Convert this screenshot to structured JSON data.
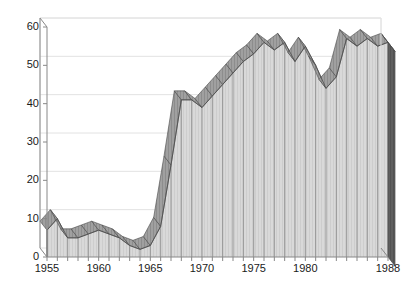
{
  "chart_data": {
    "type": "area",
    "title": "",
    "subtitle": "",
    "xlabel": "",
    "ylabel": "",
    "xlim": [
      1955,
      1988
    ],
    "ylim": [
      0,
      60
    ],
    "yticks": [
      0,
      10,
      20,
      30,
      40,
      50,
      60
    ],
    "ytick_labels": [
      "0",
      "10",
      "20",
      "30",
      "40",
      "50",
      "60"
    ],
    "xticks": [
      1955,
      1960,
      1965,
      1970,
      1975,
      1980,
      1988
    ],
    "xtick_labels": [
      "1955",
      "1960",
      "1965",
      "1970",
      "1975",
      "1980",
      "1988"
    ],
    "grid": "horizontal",
    "legend": "none",
    "style": "3d-ribbon-area",
    "x": [
      1955,
      1956,
      1957,
      1958,
      1959,
      1960,
      1961,
      1962,
      1963,
      1964,
      1965,
      1966,
      1967,
      1968,
      1969,
      1970,
      1971,
      1972,
      1973,
      1974,
      1975,
      1976,
      1977,
      1978,
      1979,
      1980,
      1981,
      1982,
      1983,
      1984,
      1985,
      1986,
      1987,
      1988
    ],
    "values": [
      7,
      10,
      5,
      5,
      6,
      7,
      6,
      5,
      3,
      2,
      3,
      8,
      24,
      41,
      41,
      39,
      42,
      45,
      48,
      51,
      53,
      56,
      54,
      56,
      51,
      55,
      50,
      44,
      47,
      57,
      55,
      57,
      55,
      56
    ],
    "series": [
      {
        "name": "value",
        "values": [
          7,
          10,
          5,
          5,
          6,
          7,
          6,
          5,
          3,
          2,
          3,
          8,
          24,
          41,
          41,
          39,
          42,
          45,
          48,
          51,
          53,
          56,
          54,
          56,
          51,
          55,
          50,
          44,
          47,
          57,
          55,
          57,
          55,
          56
        ]
      }
    ],
    "colors": {
      "face": "#d4d4d4",
      "top_ribbon": "#9a9a9a",
      "end_cap": "#5e5e5e",
      "axis": "#888888",
      "grid": "#e2e2e2",
      "text": "#1a1a1a",
      "outline": "#4a4a4a"
    }
  },
  "axes": {
    "y_title": "",
    "x_title": ""
  }
}
